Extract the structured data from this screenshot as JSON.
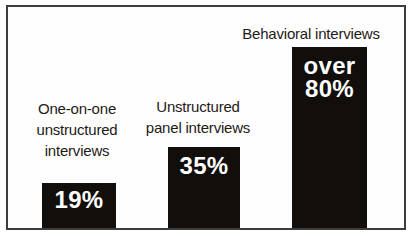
{
  "colors": {
    "bar_fill": "#110e0c",
    "value_text": "#ffffff",
    "label_text": "#1e1a17",
    "frame_border": "#3d3d3d",
    "background": "#ffffff"
  },
  "chart_data": {
    "type": "bar",
    "title": "",
    "xlabel": "",
    "ylabel": "",
    "categories": [
      "One-on-one unstructured interviews",
      "Unstructured panel interviews",
      "Behavioral interviews"
    ],
    "values": [
      19,
      35,
      80
    ],
    "value_labels": [
      "19%",
      "35%",
      "over 80%"
    ],
    "ylim": [
      0,
      100
    ],
    "grid": false,
    "legend": false,
    "axes_shown": false,
    "bar_color": "#110e0c",
    "annotations": [
      "percent values printed in white inside each bar",
      "third bar value shown as 'over 80%'"
    ]
  },
  "bars": [
    {
      "category_lines": [
        "One-on-one",
        "unstructured",
        "interviews"
      ],
      "value_lines": [
        "19%"
      ]
    },
    {
      "category_lines": [
        "Unstructured",
        "panel interviews"
      ],
      "value_lines": [
        "35%"
      ]
    },
    {
      "category_lines": [
        "Behavioral interviews"
      ],
      "value_lines": [
        "over",
        "80%"
      ]
    }
  ]
}
